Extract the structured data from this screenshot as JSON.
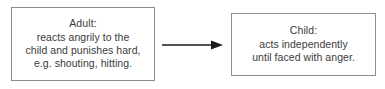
{
  "diagram": {
    "type": "flow",
    "orientation": "left-to-right",
    "background_color": "#ffffff",
    "border_color": "#8d8d8d",
    "text_color": "#3b3b3b",
    "arrow_color": "#1a1a1a",
    "nodes": [
      {
        "id": "adult",
        "title": "Adult:",
        "lines": [
          "reacts angrily to the",
          "child and punishes hard,",
          "e.g. shouting, hitting."
        ]
      },
      {
        "id": "child",
        "title": "Child:",
        "lines": [
          "acts independently",
          "until faced with anger."
        ]
      }
    ],
    "connectors": [
      {
        "id": "adult-to-child",
        "from": "adult",
        "to": "child",
        "style": "solid",
        "arrowhead": "filled-triangle",
        "label": ""
      }
    ]
  }
}
